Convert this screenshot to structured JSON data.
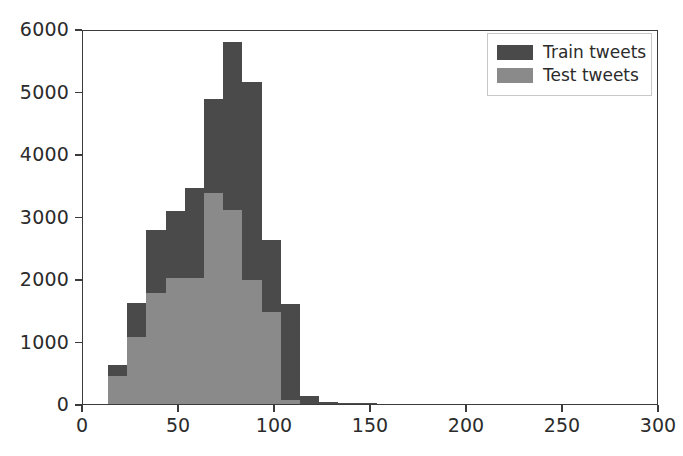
{
  "chart_data": {
    "type": "bar",
    "subtype": "histogram-overlay",
    "title": "",
    "xlabel": "",
    "ylabel": "",
    "xlim": [
      0,
      300
    ],
    "ylim": [
      0,
      6000
    ],
    "grid": false,
    "legend_position": "upper right",
    "bin_width": 10,
    "bin_starts": [
      13,
      23,
      33,
      43,
      53,
      63,
      73,
      83,
      93,
      103,
      113,
      123,
      133,
      143,
      153,
      163,
      173,
      183
    ],
    "x_ticks": [
      0,
      50,
      100,
      150,
      200,
      250,
      300
    ],
    "x_tick_labels": [
      "0",
      "50",
      "100",
      "150",
      "200",
      "250",
      "300"
    ],
    "y_ticks": [
      0,
      1000,
      2000,
      3000,
      4000,
      5000,
      6000
    ],
    "y_tick_labels": [
      "0",
      "1000",
      "2000",
      "3000",
      "4000",
      "5000",
      "6000"
    ],
    "series": [
      {
        "name": "Train tweets",
        "color": "#4a4a4a",
        "values": [
          620,
          1620,
          2780,
          3090,
          3450,
          4880,
          5800,
          5150,
          2620,
          1600,
          130,
          30,
          20,
          10,
          0,
          0,
          0,
          0
        ]
      },
      {
        "name": "Test tweets",
        "color": "#8a8a8a",
        "values": [
          450,
          1080,
          1770,
          2020,
          2010,
          3380,
          3100,
          1990,
          1470,
          60,
          0,
          0,
          0,
          0,
          0,
          0,
          0,
          0
        ]
      }
    ]
  },
  "legend": {
    "entries": [
      {
        "label": "Train tweets",
        "color": "#4a4a4a",
        "swatch": "legend-swatch-train"
      },
      {
        "label": "Test tweets",
        "color": "#8a8a8a",
        "swatch": "legend-swatch-test"
      }
    ]
  }
}
